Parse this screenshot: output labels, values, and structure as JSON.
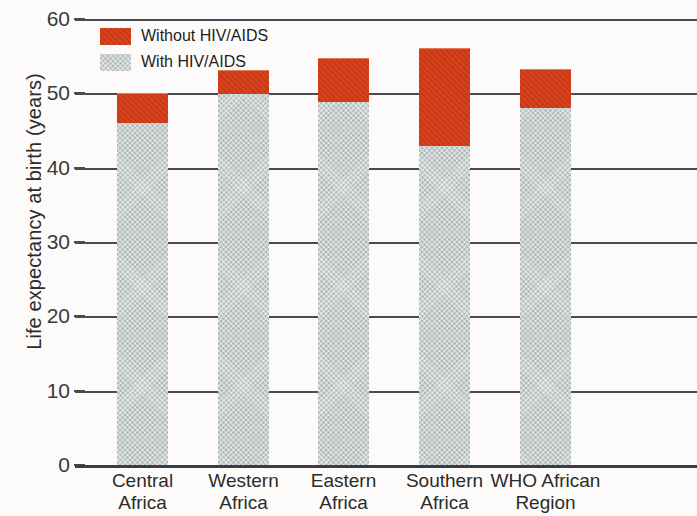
{
  "chart_data": {
    "type": "bar",
    "stacked": true,
    "title": "",
    "xlabel": "",
    "ylabel": "Life expectancy at birth (years)",
    "ylim": [
      0,
      60
    ],
    "yticks": [
      0,
      10,
      20,
      30,
      40,
      50,
      60
    ],
    "grid": true,
    "legend_position": "top-left",
    "categories": [
      "Central Africa",
      "Western Africa",
      "Eastern Africa",
      "Southern Africa",
      "WHO African Region"
    ],
    "category_lines": [
      [
        "Central",
        "Africa"
      ],
      [
        "Western",
        "Africa"
      ],
      [
        "Eastern",
        "Africa"
      ],
      [
        "Southern",
        "Africa"
      ],
      [
        "WHO African",
        "Region"
      ]
    ],
    "series": [
      {
        "name": "With HIV/AIDS",
        "color": "#b2baba",
        "values": [
          46.2,
          50.0,
          49.0,
          43.1,
          48.1
        ]
      },
      {
        "name": "Without HIV/AIDS",
        "color": "#d23a15",
        "values": [
          50.1,
          53.2,
          54.8,
          56.1,
          53.3
        ]
      }
    ]
  },
  "legend": {
    "items": [
      {
        "label": "Without HIV/AIDS",
        "swatch": "red"
      },
      {
        "label": "With HIV/AIDS",
        "swatch": "gray"
      }
    ]
  },
  "axis": {
    "y_title": "Life expectancy at birth (years)",
    "y_tick_labels": [
      "60",
      "50",
      "40",
      "30",
      "20",
      "10",
      "0"
    ]
  },
  "colors": {
    "without_hiv": "#d23a15",
    "with_hiv": "#b2baba",
    "grid": "#4a4a52",
    "text": "#2b2b2b",
    "background": "#fdfbfa"
  }
}
